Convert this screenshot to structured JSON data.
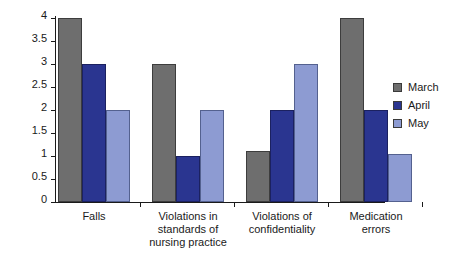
{
  "chart_data": {
    "type": "bar",
    "title": "",
    "subtitle": "",
    "xlabel": "",
    "ylabel": "",
    "ylim": [
      0,
      4
    ],
    "ytick_values": [
      0,
      0.5,
      1,
      1.5,
      2,
      2.5,
      3,
      3.5,
      4
    ],
    "ytick_labels": [
      "0",
      "0.5",
      "1",
      "1.5",
      "2",
      "2.5",
      "3",
      "3.5",
      "4"
    ],
    "grid": false,
    "legend_position": "right",
    "categories": [
      "Falls",
      "Violations in standards of nursing practice",
      "Violations of confidentiality",
      "Medication errors"
    ],
    "category_label_lines": [
      [
        "Falls"
      ],
      [
        "Violations in",
        "standards of",
        "nursing practice"
      ],
      [
        "Violations of",
        "confidentiality"
      ],
      [
        "Medication",
        "errors"
      ]
    ],
    "series": [
      {
        "name": "March",
        "color": "#6e6e6e",
        "values": [
          4,
          3,
          1.1,
          4
        ]
      },
      {
        "name": "April",
        "color": "#2a3590",
        "values": [
          3,
          1,
          2,
          2
        ]
      },
      {
        "name": "May",
        "color": "#8d9bd2",
        "values": [
          2,
          2,
          3,
          1.05
        ]
      }
    ]
  },
  "legend": {
    "items": [
      {
        "label": "March",
        "color": "#6e6e6e",
        "swatch_icon": "square-swatch-icon"
      },
      {
        "label": "April",
        "color": "#2a3590",
        "swatch_icon": "square-swatch-icon"
      },
      {
        "label": "May",
        "color": "#8d9bd2",
        "swatch_icon": "square-swatch-icon"
      }
    ]
  }
}
